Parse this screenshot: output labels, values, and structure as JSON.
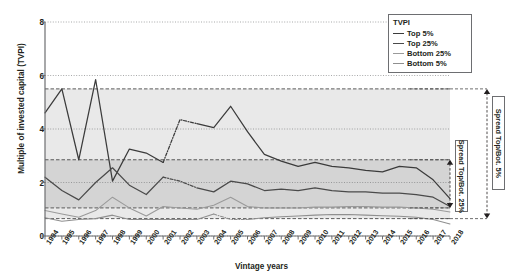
{
  "axes": {
    "ylabel": "Multiple of invested capital (TVPI)",
    "xlabel": "Vintage years",
    "yticks": [
      "0",
      "2",
      "4",
      "6",
      "8"
    ]
  },
  "legend": {
    "title": "TVPI",
    "items": [
      {
        "label": "Top 5%",
        "color": "#3b3b3b"
      },
      {
        "label": "Top 25%",
        "color": "#4a4a4a"
      },
      {
        "label": "Bottom 25%",
        "color": "#9a9a9a"
      },
      {
        "label": "Bottom 5%",
        "color": "#8f8f8f"
      }
    ]
  },
  "annotations": [
    {
      "id": "spread-5",
      "label": "Spread Top/Bot. 5%"
    },
    {
      "id": "spread-25",
      "label": "Spread Top/Bot. 25%"
    }
  ],
  "chart_data": {
    "type": "line",
    "title": "",
    "xlabel": "Vintage years",
    "ylabel": "Multiple of invested capital (TVPI)",
    "xlim": [
      1994,
      2018
    ],
    "ylim": [
      0,
      8
    ],
    "yticks": [
      0,
      2,
      4,
      6,
      8
    ],
    "grid": true,
    "legend_position": "top-right",
    "categories": [
      1994,
      1995,
      1996,
      1997,
      1998,
      1999,
      2000,
      2001,
      2002,
      2003,
      2004,
      2005,
      2006,
      2007,
      2008,
      2009,
      2010,
      2011,
      2012,
      2013,
      2014,
      2015,
      2016,
      2017,
      2018
    ],
    "series": [
      {
        "name": "Top 5%",
        "color": "#3b3b3b",
        "values": [
          4.6,
          5.5,
          2.85,
          5.85,
          2.05,
          3.25,
          3.1,
          2.75,
          4.35,
          4.2,
          4.05,
          4.85,
          3.9,
          3.05,
          2.8,
          2.6,
          2.75,
          2.6,
          2.55,
          2.45,
          2.4,
          2.6,
          2.55,
          2.1,
          1.4
        ],
        "dashed_segments": [
          [
            2001,
            2002
          ],
          [
            2002,
            2003
          ]
        ]
      },
      {
        "name": "Top 25%",
        "color": "#4a4a4a",
        "values": [
          2.2,
          1.7,
          1.35,
          2.0,
          2.55,
          1.9,
          1.55,
          2.2,
          2.05,
          1.8,
          1.65,
          2.05,
          1.95,
          1.7,
          1.75,
          1.7,
          1.8,
          1.7,
          1.65,
          1.65,
          1.6,
          1.6,
          1.55,
          1.45,
          1.1
        ],
        "dashed_segments": [
          [
            2001,
            2002
          ],
          [
            2002,
            2003
          ]
        ]
      },
      {
        "name": "Bottom 25%",
        "color": "#9a9a9a",
        "values": [
          0.95,
          0.82,
          0.7,
          0.95,
          1.45,
          1.05,
          0.75,
          1.1,
          1.05,
          1.0,
          1.15,
          1.45,
          1.1,
          1.05,
          1.05,
          1.05,
          1.08,
          1.08,
          1.1,
          1.1,
          1.08,
          1.08,
          1.05,
          1.0,
          0.9
        ],
        "dashed_segments": []
      },
      {
        "name": "Bottom 5%",
        "color": "#8f8f8f",
        "values": [
          0.68,
          0.55,
          0.62,
          0.65,
          0.78,
          0.62,
          0.62,
          0.62,
          0.62,
          0.62,
          0.82,
          0.62,
          0.62,
          0.68,
          0.72,
          0.75,
          0.78,
          0.8,
          0.8,
          0.78,
          0.76,
          0.74,
          0.7,
          0.62,
          0.45
        ],
        "dashed_segments": [
          [
            2004,
            2005
          ],
          [
            2005,
            2006
          ]
        ]
      }
    ],
    "reference_lines": [
      {
        "name": "avg-top-5",
        "value": 5.5,
        "style": "dashed"
      },
      {
        "name": "avg-top-25",
        "value": 2.85,
        "style": "dashed"
      },
      {
        "name": "avg-bottom-25",
        "value": 1.05,
        "style": "dashed"
      },
      {
        "name": "avg-bottom-5",
        "value": 0.65,
        "style": "dashed"
      }
    ],
    "bands": [
      {
        "name": "band-top5-bottom5",
        "from": 0.65,
        "to": 5.5,
        "shade": "#e9e9e9"
      },
      {
        "name": "band-top25-bottom25",
        "from": 1.05,
        "to": 2.85,
        "shade": "#d4d4d4"
      }
    ],
    "spread_markers": [
      {
        "name": "spread-5",
        "from": 0.65,
        "to": 5.5,
        "label": "Spread Top/Bot. 5%"
      },
      {
        "name": "spread-25",
        "from": 1.05,
        "to": 2.85,
        "label": "Spread Top/Bot. 25%"
      }
    ]
  }
}
